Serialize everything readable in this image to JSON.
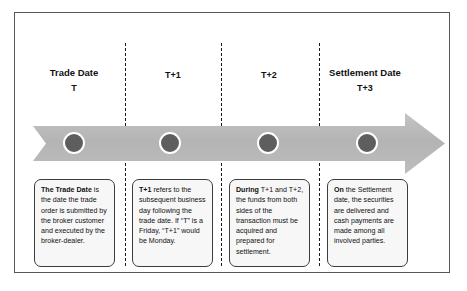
{
  "diagram": {
    "accent_color": "#b3b3b3",
    "dot_color": "#5e5e5e",
    "border_color": "#53585c",
    "columns": [
      {
        "id": "trade-date",
        "title": "Trade Date",
        "code": "T",
        "note_lead": "The Trade Date",
        "note_rest": " is the date the trade order is submitted by the broker customer and executed by the broker-dealer."
      },
      {
        "id": "t-plus-1",
        "title": "",
        "code": "T+1",
        "note_lead": "T+1",
        "note_rest": " refers to the subsequent business day following the trade date. If “T” is a Friday, “T+1” would be Monday."
      },
      {
        "id": "t-plus-2",
        "title": "",
        "code": "T+2",
        "note_lead": "During",
        "note_rest": " T+1 and T+2, the funds from both sides of the transaction must be acquired and prepared for settlement."
      },
      {
        "id": "settlement-date",
        "title": "Settlement Date",
        "code": "T+3",
        "note_lead": "On",
        "note_rest": " the Settlement date, the securities are delivered and cash payments are made among all involved parties."
      }
    ]
  }
}
